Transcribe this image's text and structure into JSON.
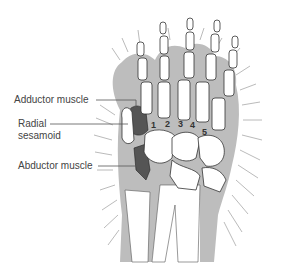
{
  "diagram": {
    "labels": {
      "adductor": "Adductor muscle",
      "radial_line1": "Radial",
      "radial_line2": "sesamoid",
      "abductor": "Abductor muscle"
    },
    "digit_numbers": [
      "1",
      "2",
      "3",
      "4",
      "5"
    ],
    "colors": {
      "fur_silhouette": "#bdbdbd",
      "bone": "#ffffff",
      "bone_outline": "#333333",
      "muscle": "#555555",
      "label_text": "#444444",
      "leader_line": "#555555",
      "hair_strokes": "#9a9a9a"
    }
  }
}
